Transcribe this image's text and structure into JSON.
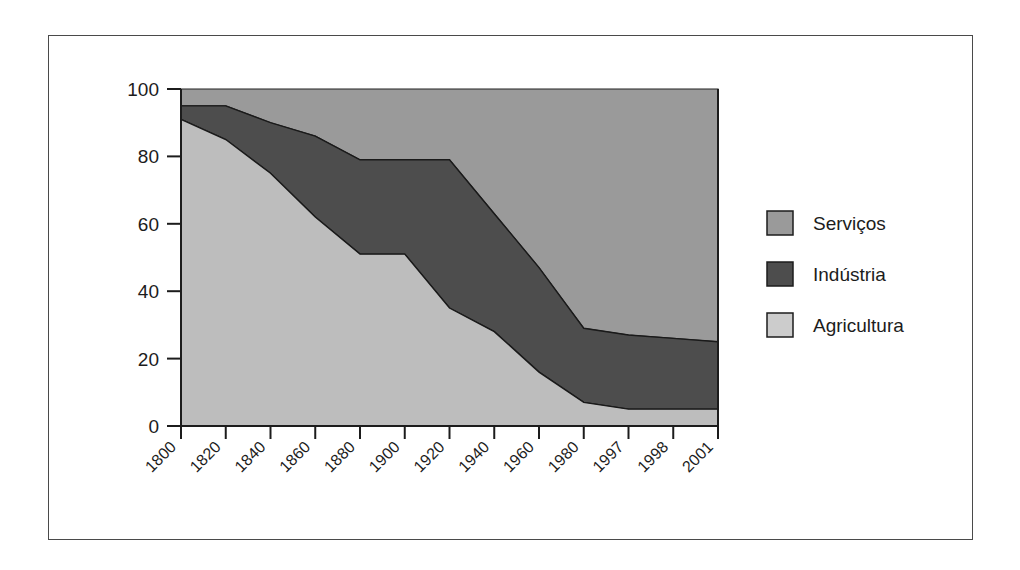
{
  "chart_data": {
    "type": "area",
    "title": "",
    "subtitle": "",
    "xlabel": "",
    "ylabel": "",
    "stacked": true,
    "grid": false,
    "legend_position": "right",
    "xlim_categories_equally_spaced": true,
    "ylim": [
      0,
      100
    ],
    "yticks": [
      0,
      20,
      40,
      60,
      80,
      100
    ],
    "ytick_labels": [
      "0",
      "20",
      "40",
      "60",
      "80",
      "100"
    ],
    "categories": [
      "1800",
      "1820",
      "1840",
      "1860",
      "1880",
      "1900",
      "1920",
      "1940",
      "1960",
      "1980",
      "1997",
      "1998",
      "2001"
    ],
    "series": [
      {
        "name": "Agricultura",
        "color": "#bdbdbd",
        "values": [
          91,
          85,
          75,
          62,
          51,
          51,
          35,
          28,
          16,
          7,
          5,
          5,
          5
        ]
      },
      {
        "name": "Indústria",
        "color": "#4d4d4d",
        "values": [
          4,
          10,
          15,
          24,
          28,
          28,
          44,
          35,
          31,
          22,
          22,
          21,
          20
        ]
      },
      {
        "name": "Serviços",
        "color": "#9a9a9a",
        "values": [
          5,
          5,
          10,
          14,
          21,
          21,
          21,
          37,
          53,
          71,
          73,
          74,
          75
        ]
      }
    ],
    "cumulative_boundaries": {
      "agricultura_top": [
        91,
        85,
        75,
        62,
        51,
        51,
        35,
        28,
        16,
        7,
        5,
        5,
        5
      ],
      "industria_top": [
        95,
        95,
        90,
        86,
        79,
        79,
        79,
        63,
        47,
        29,
        27,
        26,
        25
      ],
      "servicos_top": [
        100,
        100,
        100,
        100,
        100,
        100,
        100,
        100,
        100,
        100,
        100,
        100,
        100
      ]
    }
  },
  "legend": {
    "items": [
      {
        "label": "Serviços",
        "color": "#9a9a9a"
      },
      {
        "label": "Indústria",
        "color": "#4d4d4d"
      },
      {
        "label": "Agricultura",
        "color": "#cccccc"
      }
    ]
  },
  "colors": {
    "servicos": "#9a9a9a",
    "industria": "#4d4d4d",
    "agricultura": "#bdbdbd",
    "agricultura_legend": "#cccccc",
    "axis": "#1c1c1c",
    "frame": "#4a4a4a",
    "background": "#ffffff"
  }
}
